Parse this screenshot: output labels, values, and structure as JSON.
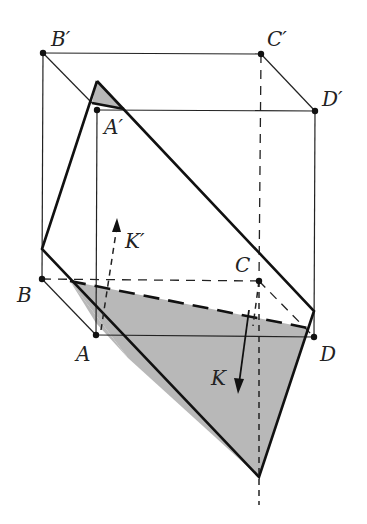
{
  "figure": {
    "vertices": {
      "B_prime": {
        "label": "B′",
        "x": 43,
        "y": 53
      },
      "C_prime": {
        "label": "C′",
        "x": 261,
        "y": 54
      },
      "A_prime": {
        "label": "A′",
        "x": 97,
        "y": 110
      },
      "D_prime": {
        "label": "D′",
        "x": 315,
        "y": 111
      },
      "B": {
        "label": "B",
        "x": 42,
        "y": 279
      },
      "C": {
        "label": "C",
        "x": 259,
        "y": 281
      },
      "A": {
        "label": "A",
        "x": 96,
        "y": 335
      },
      "D": {
        "label": "D",
        "x": 314,
        "y": 337
      }
    },
    "vectors": {
      "K": {
        "label": "K",
        "style": "solid"
      },
      "K_prime": {
        "label": "K′",
        "style": "dashed"
      }
    },
    "colors": {
      "line": "#111111",
      "shade": "#b8b8b8",
      "background": "#ffffff"
    }
  }
}
